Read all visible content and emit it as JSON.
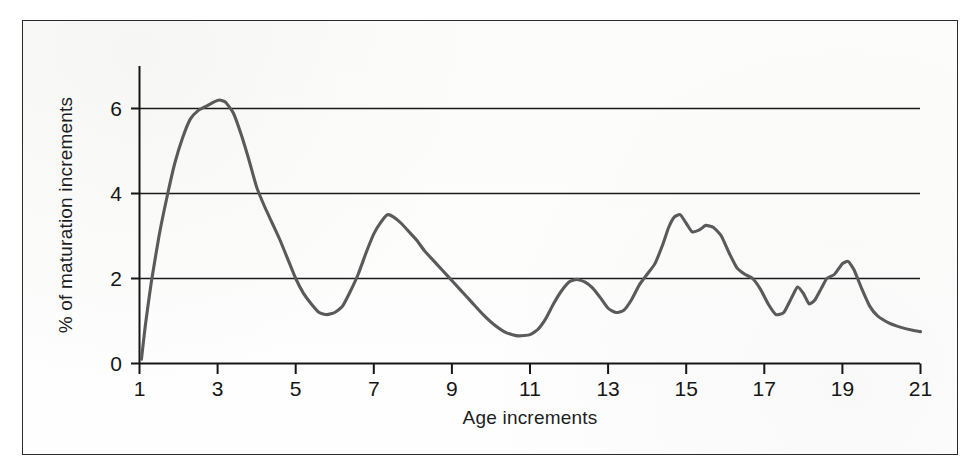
{
  "figure": {
    "frame_color": "#2b2b2b",
    "background_color": "#ffffff",
    "curve_color": "#5a5a5a",
    "axis_color": "#161616",
    "gridline_color": "#1a1a1a"
  },
  "chart_data": {
    "type": "line",
    "title": "",
    "xlabel": "Age increments",
    "ylabel": "% of maturation increments",
    "xlim": [
      1,
      21
    ],
    "ylim": [
      0,
      7
    ],
    "grid": "horizontal gridlines at y = 2, 4, 6",
    "legend": "none",
    "xticks": [
      1,
      3,
      5,
      7,
      9,
      11,
      13,
      15,
      17,
      19,
      21
    ],
    "xtick_labels": [
      "1",
      "3",
      "5",
      "7",
      "9",
      "11",
      "13",
      "15",
      "17",
      "19",
      "21"
    ],
    "xtick_minor": [
      2,
      4,
      6,
      8,
      10,
      12,
      14,
      16,
      18,
      20
    ],
    "yticks": [
      0,
      2,
      4,
      6
    ],
    "ytick_labels": [
      "0",
      "2",
      "4",
      "6"
    ],
    "series": [
      {
        "name": "% of maturation increments",
        "color": "#5a5a5a",
        "x": [
          1.05,
          1.15,
          1.3,
          1.5,
          1.7,
          1.9,
          2.1,
          2.3,
          2.5,
          2.7,
          2.9,
          3.05,
          3.2,
          3.4,
          3.6,
          3.8,
          4.0,
          4.2,
          4.4,
          4.6,
          4.8,
          5.0,
          5.2,
          5.4,
          5.6,
          5.8,
          6.0,
          6.2,
          6.4,
          6.6,
          6.8,
          7.0,
          7.2,
          7.35,
          7.5,
          7.7,
          7.9,
          8.1,
          8.3,
          8.6,
          8.9,
          9.2,
          9.5,
          9.8,
          10.1,
          10.4,
          10.7,
          11.0,
          11.2,
          11.4,
          11.6,
          11.8,
          12.0,
          12.2,
          12.4,
          12.6,
          12.8,
          13.0,
          13.2,
          13.4,
          13.6,
          13.8,
          14.0,
          14.2,
          14.4,
          14.55,
          14.7,
          14.85,
          15.0,
          15.15,
          15.35,
          15.5,
          15.7,
          15.9,
          16.1,
          16.3,
          16.5,
          16.7,
          16.9,
          17.1,
          17.3,
          17.5,
          17.7,
          17.85,
          18.0,
          18.15,
          18.3,
          18.45,
          18.6,
          18.8,
          19.0,
          19.15,
          19.3,
          19.5,
          19.7,
          19.9,
          20.2,
          20.5,
          20.8,
          21.0
        ],
        "y": [
          0.1,
          0.9,
          1.9,
          3.0,
          3.9,
          4.7,
          5.3,
          5.75,
          5.95,
          6.05,
          6.15,
          6.2,
          6.15,
          5.9,
          5.4,
          4.8,
          4.15,
          3.7,
          3.3,
          2.9,
          2.45,
          2.0,
          1.65,
          1.4,
          1.2,
          1.15,
          1.2,
          1.35,
          1.7,
          2.1,
          2.6,
          3.05,
          3.35,
          3.5,
          3.45,
          3.3,
          3.1,
          2.9,
          2.65,
          2.35,
          2.05,
          1.75,
          1.45,
          1.15,
          0.9,
          0.72,
          0.65,
          0.68,
          0.8,
          1.05,
          1.4,
          1.7,
          1.92,
          1.98,
          1.92,
          1.78,
          1.55,
          1.3,
          1.2,
          1.25,
          1.5,
          1.85,
          2.1,
          2.35,
          2.8,
          3.2,
          3.45,
          3.5,
          3.3,
          3.1,
          3.15,
          3.25,
          3.2,
          3.0,
          2.6,
          2.25,
          2.1,
          2.0,
          1.75,
          1.4,
          1.15,
          1.2,
          1.55,
          1.8,
          1.65,
          1.4,
          1.5,
          1.75,
          2.0,
          2.1,
          2.35,
          2.4,
          2.2,
          1.75,
          1.35,
          1.12,
          0.95,
          0.85,
          0.78,
          0.75
        ],
        "key_points": {
          "first_peak": {
            "x": 3.05,
            "y": 6.2
          },
          "first_trough": {
            "x": 5.8,
            "y": 1.15
          },
          "second_peak": {
            "x": 7.35,
            "y": 3.5
          },
          "global_min": {
            "x": 10.7,
            "y": 0.65
          },
          "third_peak": {
            "x": 12.2,
            "y": 1.98
          },
          "dip_at_13": {
            "x": 13.2,
            "y": 1.2
          },
          "fourth_peak": {
            "x": 14.85,
            "y": 3.5
          },
          "shoulder_peak": {
            "x": 15.5,
            "y": 3.25
          },
          "dip_at_17": {
            "x": 17.3,
            "y": 1.15
          },
          "minor_peak_18": {
            "x": 17.85,
            "y": 1.8
          },
          "minor_dip_18": {
            "x": 18.2,
            "y": 1.4
          },
          "final_peak": {
            "x": 19.15,
            "y": 2.4
          },
          "end_value": {
            "x": 21.0,
            "y": 0.75
          }
        }
      }
    ]
  }
}
